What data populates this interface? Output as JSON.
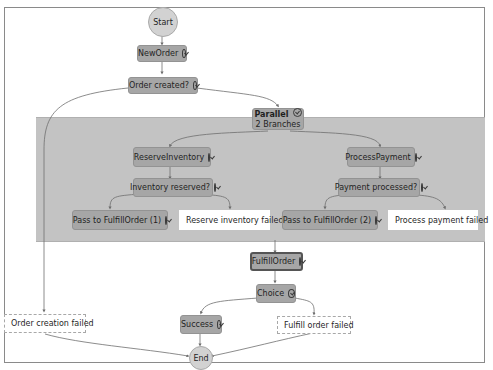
{
  "diagram": {
    "start": "Start",
    "end": "End",
    "nodes": {
      "new_order": "NewOrder",
      "order_created": "Order created?",
      "parallel": "Parallel",
      "parallel_sub": "2 Branches",
      "reserve_inventory": "ReserveInventory",
      "inventory_reserved": "Inventory reserved?",
      "pass_fulfill_1": "Pass to FulfillOrder (1)",
      "reserve_failed": "Reserve inventory failed",
      "process_payment": "ProcessPayment",
      "payment_processed": "Payment processed?",
      "pass_fulfill_2": "Pass to FulfillOrder (2)",
      "payment_failed": "Process payment failed",
      "fulfill_order": "FulfillOrder",
      "choice": "Choice",
      "success": "Success",
      "fulfill_failed": "Fulfill order failed",
      "order_creation_failed": "Order creation failed"
    },
    "colors": {
      "task_fill": "#a6a6a6",
      "parallel_region": "#c3c3c3",
      "circle_fill": "#d2d2d2",
      "edge": "#6e6e6e"
    }
  }
}
